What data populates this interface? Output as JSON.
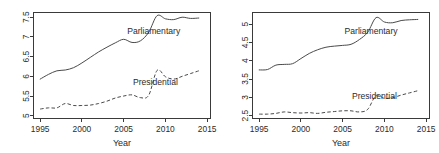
{
  "figure": {
    "title": "",
    "panel_count": 2
  },
  "chart_data": [
    {
      "id": "left",
      "type": "line",
      "title": "",
      "xlabel": "Year",
      "ylabel": "",
      "xlim": [
        1994.2,
        2015.4
      ],
      "ylim": [
        4.93,
        7.62
      ],
      "xticks": [
        1995,
        2000,
        2005,
        2010,
        2015
      ],
      "xticklabels": [
        "1995",
        "2000",
        "2005",
        "2010",
        "2015"
      ],
      "yticks": [
        5,
        5.5,
        6,
        6.5,
        7,
        7.5
      ],
      "yticklabels": [
        "5",
        "5.5",
        "6",
        "6.5",
        "7",
        "7.5"
      ],
      "grid": false,
      "legend": "inline-annotations",
      "x": [
        1995,
        1996,
        1997,
        1998,
        1999,
        2000,
        2001,
        2002,
        2003,
        2004,
        2005,
        2006,
        2007,
        2008,
        2009,
        2010,
        2011,
        2012,
        2013,
        2014
      ],
      "series": [
        {
          "name": "Parliamentary",
          "style": "solid",
          "label": "Parliamentary",
          "label_x": 2008.6,
          "label_y": 7.08,
          "values": [
            5.93,
            6.05,
            6.14,
            6.16,
            6.22,
            6.34,
            6.48,
            6.62,
            6.74,
            6.85,
            6.94,
            6.86,
            6.9,
            7.12,
            7.54,
            7.46,
            7.44,
            7.5,
            7.47,
            7.48
          ]
        },
        {
          "name": "Presidential",
          "style": "dashed",
          "label": "Presidential",
          "label_x": 2008.8,
          "label_y": 5.78,
          "values": [
            5.17,
            5.2,
            5.2,
            5.31,
            5.26,
            5.26,
            5.27,
            5.31,
            5.37,
            5.45,
            5.5,
            5.53,
            5.46,
            5.52,
            6.15,
            5.99,
            5.93,
            6.0,
            6.07,
            6.14
          ]
        }
      ]
    },
    {
      "id": "right",
      "type": "line",
      "title": "",
      "xlabel": "Year",
      "ylabel": "",
      "xlim": [
        1994.2,
        2015.4
      ],
      "ylim": [
        2.42,
        5.32
      ],
      "xticks": [
        1995,
        2000,
        2005,
        2010,
        2015
      ],
      "xticklabels": [
        "1995",
        "2000",
        "2005",
        "2010",
        "2015"
      ],
      "yticks": [
        2.5,
        3,
        3.5,
        4,
        4.5,
        5
      ],
      "yticklabels": [
        "2.5",
        "3",
        "3.5",
        "4",
        "4.5",
        "5"
      ],
      "grid": false,
      "legend": "inline-annotations",
      "x": [
        1995,
        1996,
        1997,
        1998,
        1999,
        2000,
        2001,
        2002,
        2003,
        2004,
        2005,
        2006,
        2007,
        2008,
        2009,
        2010,
        2011,
        2012,
        2013,
        2014
      ],
      "series": [
        {
          "name": "Parliamentary",
          "style": "solid",
          "label": "Parliamentary",
          "label_x": 2008.4,
          "label_y": 4.72,
          "values": [
            3.75,
            3.76,
            3.88,
            3.9,
            3.92,
            4.06,
            4.2,
            4.3,
            4.37,
            4.4,
            4.42,
            4.45,
            4.58,
            4.78,
            5.18,
            5.06,
            5.04,
            5.1,
            5.12,
            5.13
          ]
        },
        {
          "name": "Presidential",
          "style": "dashed",
          "label": "Presidential",
          "label_x": 2008.8,
          "label_y": 2.94,
          "values": [
            2.54,
            2.54,
            2.56,
            2.6,
            2.58,
            2.57,
            2.58,
            2.56,
            2.59,
            2.61,
            2.63,
            2.63,
            2.6,
            2.67,
            3.05,
            2.97,
            2.99,
            3.06,
            3.12,
            3.18
          ]
        }
      ]
    }
  ]
}
